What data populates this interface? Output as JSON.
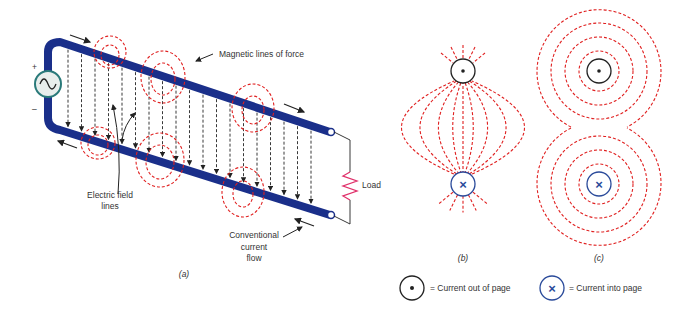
{
  "figure": {
    "panel_a": {
      "caption": "(a)",
      "labels": {
        "magnetic": "Magnetic lines of force",
        "electric_line1": "Electric field",
        "electric_line2": "lines",
        "load": "Load",
        "current_line1": "Conventional",
        "current_line2": "current",
        "current_line3": "flow",
        "plus": "+",
        "minus": "–"
      }
    },
    "panel_b": {
      "caption": "(b)"
    },
    "panel_c": {
      "caption": "(c)"
    },
    "legend": {
      "out_of_page": "= Current out of page",
      "into_page": "= Current into page"
    },
    "colors": {
      "conductor": "#1a2f8a",
      "magnetic_field": "#e02020",
      "electric_field": "#222222",
      "load": "#e0306a",
      "into_page_symbol": "#2a4a9a"
    }
  }
}
